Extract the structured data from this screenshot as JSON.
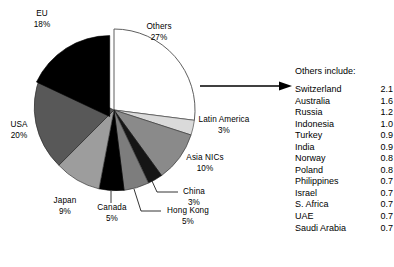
{
  "chart_data": {
    "type": "pie",
    "title": "",
    "unit": "%",
    "categories": [
      "Others",
      "Latin America",
      "Asia NICs",
      "China",
      "Hong Kong",
      "Canada",
      "Japan",
      "USA",
      "EU"
    ],
    "values": [
      27,
      3,
      10,
      3,
      5,
      5,
      9,
      20,
      18
    ],
    "labels": [
      {
        "name": "Others",
        "value": "27%"
      },
      {
        "name": "Latin America",
        "value": "3%"
      },
      {
        "name": "Asia NICs",
        "value": "10%"
      },
      {
        "name": "China",
        "value": "3%"
      },
      {
        "name": "Hong Kong",
        "value": "5%"
      },
      {
        "name": "Canada",
        "value": "5%"
      },
      {
        "name": "Japan",
        "value": "9%"
      },
      {
        "name": "USA",
        "value": "20%"
      },
      {
        "name": "EU",
        "value": "18%"
      }
    ],
    "slice_colors": [
      "#ffffff",
      "#d9d9d9",
      "#8c8c8c",
      "#1a1a1a",
      "#808080",
      "#000000",
      "#9e9e9e",
      "#595959",
      "#000000"
    ],
    "exploded_slice": "EU",
    "legend": "none",
    "grid": false
  },
  "pie": {
    "eu": {
      "name": "EU",
      "value": "18%"
    },
    "others": {
      "name": "Others",
      "value": "27%"
    },
    "latin_america": {
      "name": "Latin America",
      "value": "3%"
    },
    "asia_nics": {
      "name": "Asia NICs",
      "value": "10%"
    },
    "china": {
      "name": "China",
      "value": "3%"
    },
    "hong_kong": {
      "name": "Hong Kong",
      "value": "5%"
    },
    "canada": {
      "name": "Canada",
      "value": "5%"
    },
    "japan": {
      "name": "Japan",
      "value": "9%"
    },
    "usa": {
      "name": "USA",
      "value": "20%"
    }
  },
  "others_panel": {
    "title": "Others include:",
    "rows": [
      {
        "name": "Switzerland",
        "value": "2.1"
      },
      {
        "name": "Australia",
        "value": "1.6"
      },
      {
        "name": "Russia",
        "value": "1.2"
      },
      {
        "name": "Indonesia",
        "value": "1.0"
      },
      {
        "name": "Turkey",
        "value": "0.9"
      },
      {
        "name": "India",
        "value": "0.9"
      },
      {
        "name": "Norway",
        "value": "0.8"
      },
      {
        "name": "Poland",
        "value": "0.8"
      },
      {
        "name": "Philippines",
        "value": "0.7"
      },
      {
        "name": "Israel",
        "value": "0.7"
      },
      {
        "name": "S. Africa",
        "value": "0.7"
      },
      {
        "name": "UAE",
        "value": "0.7"
      },
      {
        "name": "Saudi Arabia",
        "value": "0.7"
      }
    ]
  }
}
